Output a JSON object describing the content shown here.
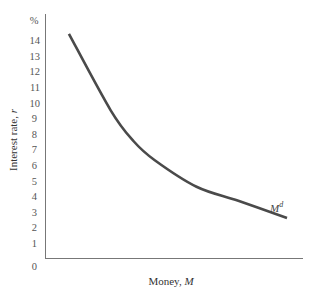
{
  "chart_data": {
    "type": "line",
    "title": "",
    "xlabel": "Money, M",
    "xlabel_parts": {
      "text": "Money, ",
      "italic": "M"
    },
    "ylabel": "Interest rate, r",
    "ylabel_parts": {
      "text": "Interest rate, ",
      "italic": "r"
    },
    "y_unit_label": "%",
    "y_ticks": [
      0,
      1,
      2,
      3,
      4,
      5,
      6,
      7,
      8,
      9,
      10,
      11,
      12,
      13,
      14
    ],
    "ylim": [
      0,
      15
    ],
    "x_ticks": [],
    "grid": false,
    "legend": "none",
    "series": [
      {
        "name": "Md",
        "label_main": "M",
        "label_sup": "d",
        "color": "#4a4a4a",
        "x": [
          0.06,
          0.24,
          0.34,
          0.43,
          0.61,
          0.79,
          1.0
        ],
        "values": [
          14.4,
          9.5,
          7.5,
          6.3,
          4.6,
          3.7,
          2.6
        ]
      }
    ],
    "annotations": [
      {
        "text": "Md",
        "position": "near right end of curve"
      }
    ]
  }
}
